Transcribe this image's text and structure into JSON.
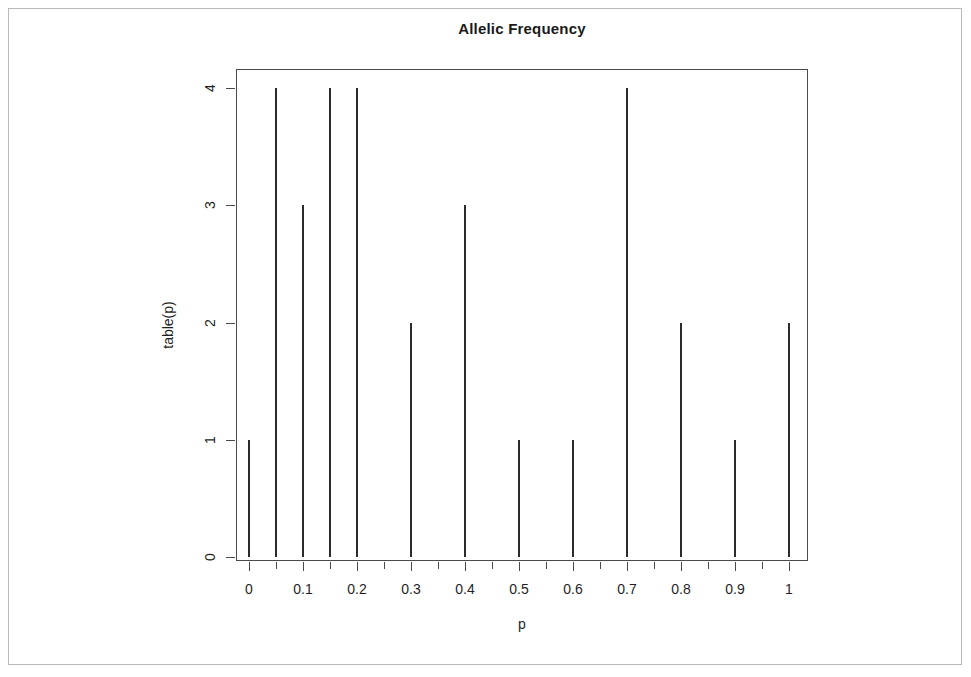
{
  "figure": {
    "title": "Allelic Frequency",
    "xlabel": "p",
    "ylabel": "table(p)"
  },
  "axes": {
    "x_tick_labels": [
      "0",
      "0.1",
      "0.2",
      "0.3",
      "0.4",
      "0.5",
      "0.6",
      "0.7",
      "0.8",
      "0.9",
      "1"
    ],
    "y_tick_labels": [
      "0",
      "1",
      "2",
      "3",
      "4"
    ]
  },
  "colors": {
    "bar": "#2b2b2b",
    "axis": "#4a4a4a",
    "text": "#1f1f1f",
    "page_frame": "#b9b9b9",
    "background": "#ffffff"
  },
  "chart_data": {
    "type": "bar",
    "title": "Allelic Frequency",
    "xlabel": "p",
    "ylabel": "table(p)",
    "grid": false,
    "legend": false,
    "xlim": [
      -0.025,
      1.035
    ],
    "ylim": [
      0,
      4
    ],
    "xticks": [
      0,
      0.1,
      0.2,
      0.3,
      0.4,
      0.5,
      0.6,
      0.7,
      0.8,
      0.9,
      1
    ],
    "xticks_minor": [
      0.05,
      0.15,
      0.25,
      0.35,
      0.45,
      0.55,
      0.65,
      0.75,
      0.85,
      0.95
    ],
    "yticks": [
      0,
      1,
      2,
      3,
      4
    ],
    "categories": [
      "0",
      "0.05",
      "0.1",
      "0.15",
      "0.2",
      "0.3",
      "0.4",
      "0.5",
      "0.6",
      "0.7",
      "0.8",
      "0.9",
      "1"
    ],
    "x": [
      0,
      0.05,
      0.1,
      0.15,
      0.2,
      0.3,
      0.4,
      0.5,
      0.6,
      0.7,
      0.8,
      0.9,
      1
    ],
    "values": [
      1,
      4,
      3,
      4,
      4,
      2,
      3,
      1,
      1,
      4,
      2,
      1,
      2
    ]
  }
}
